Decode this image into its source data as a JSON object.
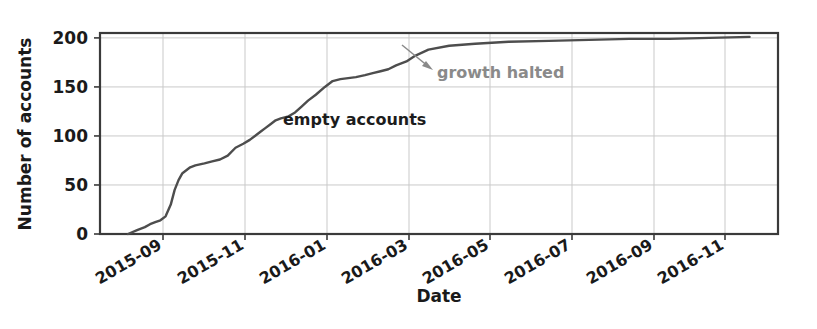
{
  "chart_data": {
    "type": "line",
    "title": "",
    "xlabel": "Date",
    "ylabel": "Number of accounts",
    "ylim": [
      0,
      205
    ],
    "yticks": [
      0,
      50,
      100,
      150,
      200
    ],
    "ytick_labels": [
      "0",
      "50",
      "100",
      "150",
      "200"
    ],
    "xtick_labels": [
      "2015-09",
      "2015-11",
      "2016-01",
      "2016-03",
      "2016-05",
      "2016-07",
      "2016-09",
      "2016-11"
    ],
    "xtick_rotation_deg": -30,
    "grid": true,
    "legend": "none",
    "line_color": "#4d4d4d",
    "series": [
      {
        "name": "empty accounts",
        "x": [
          "2015-08-05",
          "2015-08-12",
          "2015-08-18",
          "2015-08-22",
          "2015-08-26",
          "2015-08-30",
          "2015-09-03",
          "2015-09-07",
          "2015-09-10",
          "2015-09-13",
          "2015-09-16",
          "2015-09-19",
          "2015-09-22",
          "2015-09-26",
          "2015-10-02",
          "2015-10-08",
          "2015-10-14",
          "2015-10-20",
          "2015-10-26",
          "2015-11-01",
          "2015-11-06",
          "2015-11-10",
          "2015-11-14",
          "2015-11-18",
          "2015-11-22",
          "2015-11-26",
          "2015-11-30",
          "2015-12-05",
          "2015-12-10",
          "2015-12-15",
          "2015-12-20",
          "2015-12-26",
          "2016-01-02",
          "2016-01-08",
          "2016-01-14",
          "2016-01-20",
          "2016-01-26",
          "2016-02-02",
          "2016-02-08",
          "2016-02-14",
          "2016-02-20",
          "2016-02-26",
          "2016-03-03",
          "2016-03-10",
          "2016-03-20",
          "2016-04-05",
          "2016-04-25",
          "2016-05-20",
          "2016-06-20",
          "2016-07-20",
          "2016-08-20",
          "2016-09-20",
          "2016-10-20",
          "2016-11-20"
        ],
        "y": [
          0,
          4,
          7,
          10,
          12,
          14,
          18,
          30,
          45,
          55,
          62,
          65,
          68,
          70,
          72,
          74,
          76,
          80,
          88,
          92,
          96,
          100,
          104,
          108,
          112,
          116,
          118,
          120,
          124,
          130,
          136,
          142,
          150,
          156,
          158,
          159,
          160,
          162,
          164,
          166,
          168,
          172,
          176,
          182,
          188,
          192,
          194,
          196,
          197,
          198,
          199,
          199,
          200,
          201
        ]
      }
    ],
    "annotations": [
      {
        "id": "empty-accounts",
        "text": "empty accounts",
        "color": "#1c1c1c",
        "x_px": 283,
        "y_px": 125
      },
      {
        "id": "growth-halted",
        "text": "growth halted",
        "color": "#8a8a8a",
        "x_px": 436,
        "y_px": 76,
        "arrow": {
          "from_x_px": 403,
          "from_y_px": 46,
          "to_x_px": 433,
          "to_y_px": 70
        }
      }
    ]
  },
  "axes": {
    "ylabel": "Number of accounts",
    "xlabel": "Date",
    "ytick_labels": [
      "200",
      "150",
      "100",
      "50",
      "0"
    ],
    "xtick_labels": [
      "2015-09",
      "2015-11",
      "2016-01",
      "2016-03",
      "2016-05",
      "2016-07",
      "2016-09",
      "2016-11"
    ]
  },
  "annotations": {
    "empty_accounts": "empty accounts",
    "growth_halted": "growth halted"
  },
  "colors": {
    "line": "#4d4d4d",
    "grid": "#c9c9c9",
    "frame": "#3a3a3a",
    "text": "#1a1a1a",
    "annotation_gray": "#8a8a8a"
  }
}
